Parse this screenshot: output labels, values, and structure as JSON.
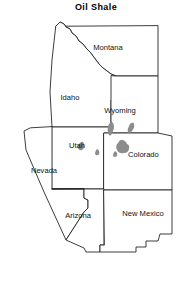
{
  "title": "Oil Shale",
  "map": {
    "type": "thematic-resource-map",
    "region": "Western United States",
    "background_color": "#ffffff",
    "border_color": "#1a1a1a",
    "deposit_color": "#8c8c8c",
    "states": [
      {
        "name": "Montana",
        "label_x": 108,
        "label_y": 50
      },
      {
        "name": "Idaho",
        "label_y": 100,
        "label_x": 70
      },
      {
        "name": "Wyoming",
        "label_x": 120,
        "label_y": 113
      },
      {
        "name": "Utah",
        "label_x": 77,
        "label_y": 148
      },
      {
        "name": "Colorado",
        "label_x": 152,
        "label_y": 157
      },
      {
        "name": "Nevada",
        "label_x": 44,
        "label_y": 173
      },
      {
        "name": "Arizona",
        "label_x": 78,
        "label_y": 218
      },
      {
        "name": "New Mexico",
        "label_x": 143,
        "label_y": 216
      }
    ],
    "deposits": {
      "legend_name": "oil shale deposit",
      "count": 6,
      "located_in": [
        "Wyoming",
        "Utah",
        "Colorado"
      ],
      "color": "#8c8c8c"
    }
  }
}
